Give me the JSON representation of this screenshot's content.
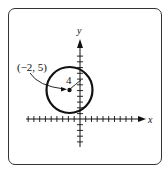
{
  "diagram": {
    "axes": {
      "x_label": "x",
      "y_label": "y"
    },
    "circle": {
      "center_label": "(−2, 5)",
      "center": [
        -2,
        5
      ],
      "radius": 4,
      "radius_label": "4"
    }
  }
}
